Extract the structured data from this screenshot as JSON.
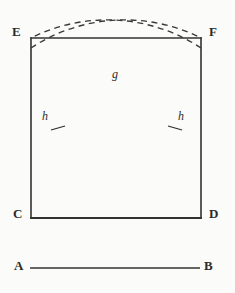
{
  "figure": {
    "caption": "",
    "background_color": "#fbfbf9",
    "ink_color": "#2b2b2b",
    "labels": {
      "top_left": "E",
      "top_right": "F",
      "bottom_left": "C",
      "bottom_right": "D",
      "segment_start": "A",
      "segment_end": "B",
      "arc_intersection": "g",
      "arc_mark_left": "h",
      "arc_mark_right": "h"
    },
    "geometry": {
      "square": {
        "left": 31,
        "top": 38,
        "right": 201,
        "bottom": 218
      },
      "segment_ab": {
        "x1": 30,
        "y1": 268,
        "x2": 200,
        "y2": 268
      },
      "arc_c_to_f": {
        "center": "C",
        "radius": 170,
        "from": "C",
        "to": "F",
        "style": "dashed"
      },
      "arc_d_to_e": {
        "center": "D",
        "radius": 170,
        "from": "D",
        "to": "E",
        "style": "dashed"
      },
      "intersection_point": {
        "x": 116,
        "y": 62
      },
      "tick_left": {
        "x": 57,
        "y": 128
      },
      "tick_right": {
        "x": 175,
        "y": 128
      }
    }
  }
}
